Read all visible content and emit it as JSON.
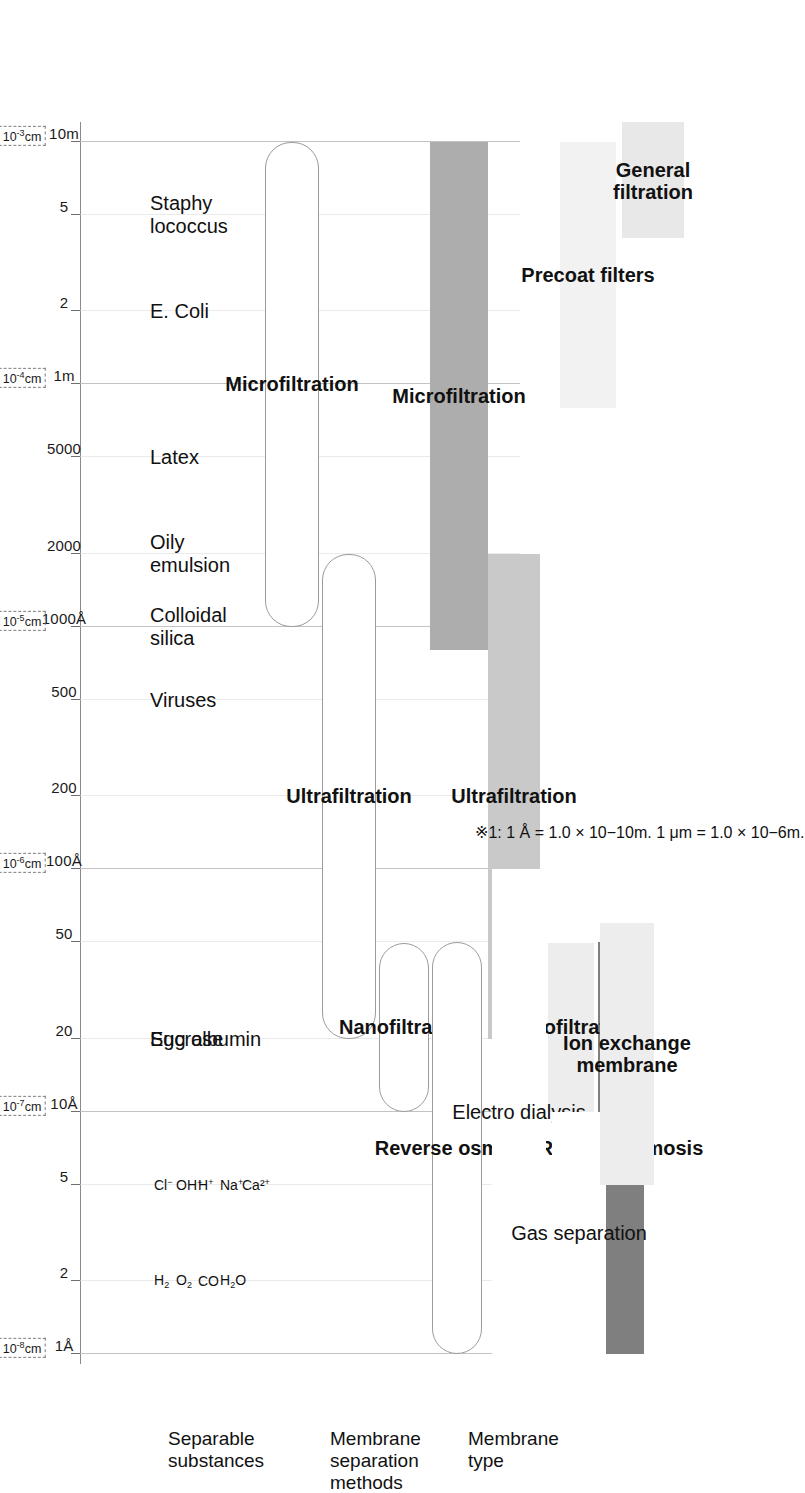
{
  "chart_data": {
    "type": "bar",
    "xlabel": "Particle / molecule size",
    "ylabel": "",
    "orientation": "rotated-90",
    "axis": {
      "name": "size-scale",
      "scale": "log",
      "ticks": [
        {
          "label": "1Å",
          "value": 1,
          "decade": "10⁻⁸cm"
        },
        {
          "label": "2",
          "value": 2,
          "decade": ""
        },
        {
          "label": "5",
          "value": 5,
          "decade": ""
        },
        {
          "label": "10Å",
          "value": 10,
          "decade": "10⁻⁷cm"
        },
        {
          "label": "20",
          "value": 20,
          "decade": ""
        },
        {
          "label": "50",
          "value": 50,
          "decade": ""
        },
        {
          "label": "100Å",
          "value": 100,
          "decade": "10⁻⁶cm"
        },
        {
          "label": "200",
          "value": 200,
          "decade": ""
        },
        {
          "label": "500",
          "value": 500,
          "decade": ""
        },
        {
          "label": "1000Å",
          "value": 1000,
          "decade": "10⁻⁵cm"
        },
        {
          "label": "2000",
          "value": 2000,
          "decade": ""
        },
        {
          "label": "5000",
          "value": 5000,
          "decade": ""
        },
        {
          "label": "1m",
          "value": 10000,
          "decade": "10⁻⁴cm"
        },
        {
          "label": "2",
          "value": 20000,
          "decade": ""
        },
        {
          "label": "5",
          "value": 50000,
          "decade": ""
        },
        {
          "label": "10m",
          "value": 100000,
          "decade": "10⁻³cm"
        }
      ]
    },
    "rows": [
      {
        "name": "separable-substances",
        "label": "Separable\nsubstances"
      },
      {
        "name": "membrane-separation-methods",
        "label": "Membrane\nseparation\nmethods"
      },
      {
        "name": "membrane-type",
        "label": "Membrane\ntype"
      }
    ],
    "substances": [
      {
        "name": "staphylococcus",
        "label": "Staphy\nlococcus",
        "value": 50000
      },
      {
        "name": "e-coli",
        "label": "E. Coli",
        "value": 20000
      },
      {
        "name": "latex",
        "label": "Latex",
        "value": 5000
      },
      {
        "name": "oily-emulsion",
        "label": "Oily\nemulsion",
        "value": 2000
      },
      {
        "name": "colloidal-silica",
        "label": "Colloidal\nsilica",
        "value": 1000
      },
      {
        "name": "viruses",
        "label": "Viruses",
        "value": 500
      },
      {
        "name": "egg-albumin",
        "label": "Egg albumin",
        "value": 20
      },
      {
        "name": "sucrose",
        "label": "Sucrose",
        "value": 18
      }
    ],
    "ions": [
      {
        "name": "chloride-ion",
        "label": "Cl⁻"
      },
      {
        "name": "hydroxide-ion",
        "label": "OH⁻"
      },
      {
        "name": "hydrogen-ion",
        "label": "H⁺"
      },
      {
        "name": "sodium-ion",
        "label": "Na⁺"
      },
      {
        "name": "calcium-ion",
        "label": "Ca²⁺"
      }
    ],
    "gases": [
      {
        "name": "hydrogen-molecule",
        "label": "H₂"
      },
      {
        "name": "oxygen-molecule",
        "label": "O₂"
      },
      {
        "name": "carbon-monoxide",
        "label": "CO"
      },
      {
        "name": "water-molecule",
        "label": "H₂O"
      }
    ],
    "methods": [
      {
        "name": "microfiltration",
        "label": "Microfiltration",
        "from": 1000,
        "to": 100000
      },
      {
        "name": "ultrafiltration",
        "label": "Ultrafiltration",
        "from": 20,
        "to": 2000
      },
      {
        "name": "nanofiltration",
        "label": "Nanofiltration",
        "from": 10,
        "to": 50
      },
      {
        "name": "reverse-osmosis",
        "label": "Reverse osmosis",
        "from": 1,
        "to": 50
      }
    ],
    "membrane_types": [
      {
        "name": "microfiltration-membrane",
        "label": "Microfiltration",
        "from": 800,
        "to": 100000,
        "color": "#adadad"
      },
      {
        "name": "ultrafiltration-membrane",
        "label": "Ultrafiltration",
        "from": 20,
        "to": 2000,
        "color": "#c9c9c9"
      },
      {
        "name": "reverse-osmosis-membrane",
        "label": "Reverse osmosis",
        "from": 1,
        "to": 50,
        "color": "#7f7f7f"
      },
      {
        "name": "nanofiltration-membrane",
        "label": "Nanofiltration",
        "from": 10,
        "to": 50,
        "color": "#ededed"
      },
      {
        "name": "electro-dialysis",
        "label": "Electro dialysis",
        "from": 1,
        "to": 100,
        "color": "#ffffff"
      },
      {
        "name": "gas-separation",
        "label": "Gas separation",
        "from": 1,
        "to": 10,
        "color": "#ffffff"
      },
      {
        "name": "ion-exchange-membrane",
        "label": "Ion exchange\nmembrane",
        "from": 5,
        "to": 60,
        "color": "#ededed"
      },
      {
        "name": "precoat-filters",
        "label": "Precoat filters",
        "from": 8000,
        "to": 100000,
        "color": "#f2f2f2"
      },
      {
        "name": "general-filtration",
        "label": "General\nfiltration",
        "from": 40000,
        "to": 120000,
        "color": "#e8e8e8"
      }
    ],
    "footnote": "※1: 1 Å = 1.0 × 10−10m. 1 μm = 1.0 × 10−6m.",
    "colors": {
      "microfiltration": "#adadad",
      "ultrafiltration": "#c9c9c9",
      "reverse_osmosis": "#7f7f7f",
      "nanofiltration": "#ededed",
      "light_band": "#f2f2f2",
      "grid": "#d8d8d8",
      "axis": "#8a8a8a"
    }
  }
}
